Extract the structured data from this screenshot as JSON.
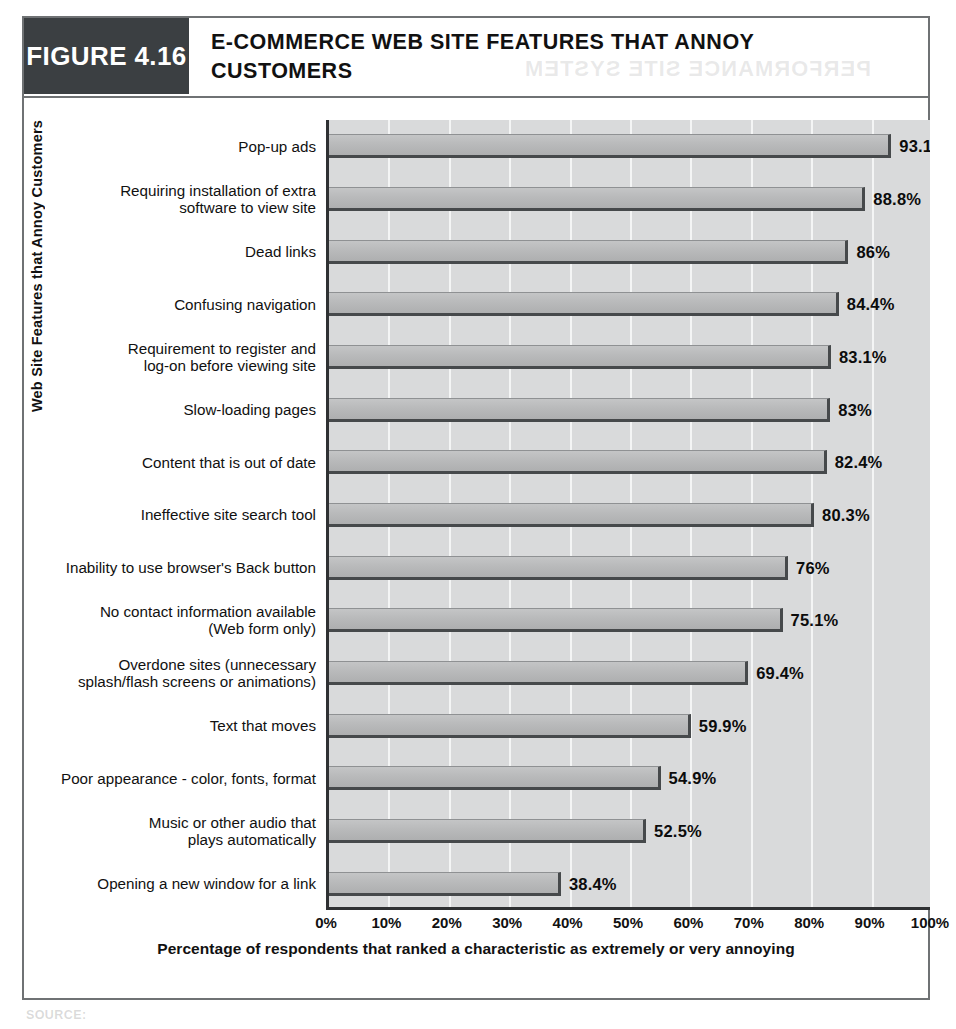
{
  "figure": {
    "number_label": "FIGURE 4.16",
    "title": "E-COMMERCE WEB SITE FEATURES THAT ANNOY CUSTOMERS",
    "ghost_text": "PERFORMANCE SITE SYSTEM",
    "source_note": "SOURCE:"
  },
  "colors": {
    "header_band": "#3b3f42",
    "frame_border": "#6f7274",
    "plot_background": "#d9dadb",
    "gridline": "#f4f5f5",
    "bar_fill": "#bcbdbe",
    "bar_shadow": "#46494b",
    "axis_line": "#2f3133",
    "text": "#111111"
  },
  "chart_data": {
    "type": "bar",
    "orientation": "horizontal",
    "title": "E-COMMERCE WEB SITE FEATURES THAT ANNOY CUSTOMERS",
    "xlabel": "Percentage of respondents that ranked a characteristic as extremely or very annoying",
    "ylabel": "Web Site Features that Annoy Customers",
    "xlim": [
      0,
      100
    ],
    "xticks": [
      "0%",
      "10%",
      "20%",
      "30%",
      "40%",
      "50%",
      "60%",
      "70%",
      "80%",
      "90%",
      "100%"
    ],
    "xtick_values": [
      0,
      10,
      20,
      30,
      40,
      50,
      60,
      70,
      80,
      90,
      100
    ],
    "grid": "vertical",
    "legend": "none",
    "categories": [
      "Pop-up ads",
      "Requiring installation of extra\nsoftware to view site",
      "Dead links",
      "Confusing navigation",
      "Requirement to register and\nlog-on before viewing site",
      "Slow-loading pages",
      "Content that is out of date",
      "Ineffective site search tool",
      "Inability to use browser's Back button",
      "No contact information available\n(Web form only)",
      "Overdone sites (unnecessary\nsplash/flash screens or animations)",
      "Text that moves",
      "Poor appearance - color, fonts, format",
      "Music or other audio that\nplays automatically",
      "Opening a new window for a link"
    ],
    "values": [
      93.1,
      88.8,
      86,
      84.4,
      83.1,
      83,
      82.4,
      80.3,
      76,
      75.1,
      69.4,
      59.9,
      54.9,
      52.5,
      38.4
    ],
    "value_labels": [
      "93.1%",
      "88.8%",
      "86%",
      "84.4%",
      "83.1%",
      "83%",
      "82.4%",
      "80.3%",
      "76%",
      "75.1%",
      "69.4%",
      "59.9%",
      "54.9%",
      "52.5%",
      "38.4%"
    ]
  }
}
